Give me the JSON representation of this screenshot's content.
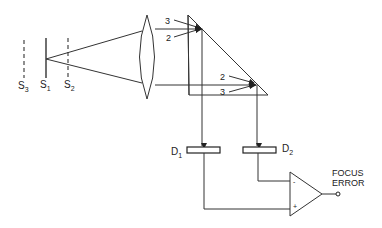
{
  "diagram": {
    "planes": [
      {
        "id": "S3",
        "letter": "S",
        "sub": "3",
        "style": "dashed"
      },
      {
        "id": "S1",
        "letter": "S",
        "sub": "1",
        "style": "solid"
      },
      {
        "id": "S2",
        "letter": "S",
        "sub": "2",
        "style": "dashed"
      }
    ],
    "lens": {
      "type": "biconvex"
    },
    "prism": {
      "upper_arrows": [
        {
          "label": "3"
        },
        {
          "label": "2"
        }
      ],
      "lower_arrows": [
        {
          "label": "2"
        },
        {
          "label": "3"
        }
      ]
    },
    "detectors": [
      {
        "id": "D1",
        "letter": "D",
        "sub": "1"
      },
      {
        "id": "D2",
        "letter": "D",
        "sub": "2"
      }
    ],
    "amplifier": {
      "inverting_sign": "-",
      "noninverting_sign": "+",
      "output_label_line1": "FOCUS",
      "output_label_line2": "ERROR"
    }
  }
}
